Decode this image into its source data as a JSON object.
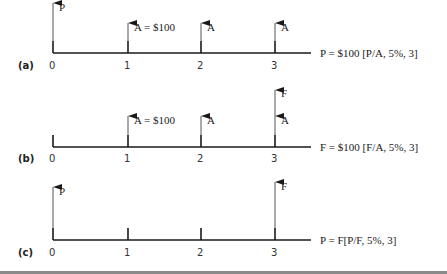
{
  "colors": {
    "line": "#1a1a1a",
    "arrow_shaft": "#555555",
    "text": "#222222",
    "rule": "#8a8a8a"
  },
  "diagrams": [
    {
      "label": "(a)",
      "ticks": [
        "0",
        "1",
        "2",
        "3"
      ],
      "arrows": [
        {
          "period": 0,
          "label": "P",
          "height": "tall"
        },
        {
          "period": 1,
          "label": "A = $100",
          "height": "short"
        },
        {
          "period": 2,
          "label": "A",
          "height": "short"
        },
        {
          "period": 3,
          "label": "A",
          "height": "short"
        }
      ],
      "equation": "P = $100 [P/A, 5%, 3]"
    },
    {
      "label": "(b)",
      "ticks": [
        "0",
        "1",
        "2",
        "3"
      ],
      "arrows": [
        {
          "period": 1,
          "label": "A = $100",
          "height": "short"
        },
        {
          "period": 2,
          "label": "A",
          "height": "short"
        },
        {
          "period": 3,
          "label": "A",
          "height": "short"
        },
        {
          "period": 3,
          "label": "F",
          "height": "tall"
        }
      ],
      "equation": "F = $100 [F/A, 5%, 3]"
    },
    {
      "label": "(c)",
      "ticks": [
        "0",
        "1",
        "2",
        "3"
      ],
      "arrows": [
        {
          "period": 0,
          "label": "P",
          "height": "tall"
        },
        {
          "period": 3,
          "label": "F",
          "height": "tall"
        }
      ],
      "equation": "P = F[P/F, 5%, 3]"
    }
  ]
}
